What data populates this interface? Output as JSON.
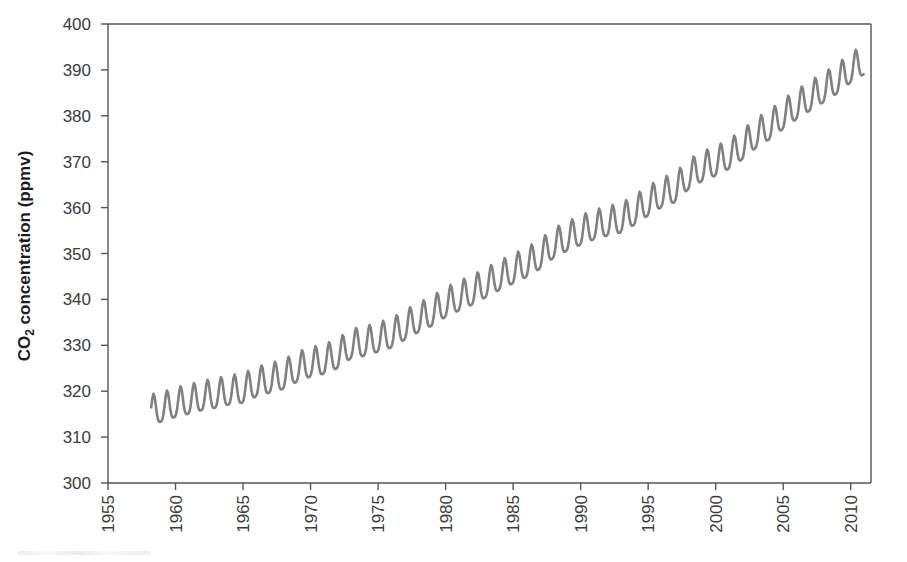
{
  "chart_data": {
    "type": "line",
    "title": "",
    "subtitle": "",
    "xlabel": "",
    "ylabel": "CO2 concentration (ppmv)",
    "ylabel_rich": {
      "prefix": "CO",
      "sub": "2",
      "suffix": " concentration (ppmv)"
    },
    "xlim": [
      1955,
      2011.5
    ],
    "ylim": [
      300,
      400
    ],
    "xticks": [
      1955,
      1960,
      1965,
      1970,
      1975,
      1980,
      1985,
      1990,
      1995,
      2000,
      2005,
      2010
    ],
    "xtick_labels": [
      "1955",
      "1960",
      "1965",
      "1970",
      "1975",
      "1980",
      "1985",
      "1990",
      "1995",
      "2000",
      "2005",
      "2010"
    ],
    "xtick_rotation": 90,
    "yticks": [
      300,
      310,
      320,
      330,
      340,
      350,
      360,
      370,
      380,
      390,
      400
    ],
    "ytick_labels": [
      "300",
      "310",
      "320",
      "330",
      "340",
      "350",
      "360",
      "370",
      "380",
      "390",
      "400"
    ],
    "grid": false,
    "legend": "none",
    "series": [
      {
        "name": "Mauna Loa monthly mean CO2",
        "color": "#808080",
        "line_width": 2.6,
        "marker": "none",
        "seasonal_amplitude_ppmv": 3.2,
        "seasonal_peak_month": 5,
        "x_start": 1958.2,
        "x_end": 2011.0,
        "annual_mean_x": [
          1958,
          1959,
          1960,
          1961,
          1962,
          1963,
          1964,
          1965,
          1966,
          1967,
          1968,
          1969,
          1970,
          1971,
          1972,
          1973,
          1974,
          1975,
          1976,
          1977,
          1978,
          1979,
          1980,
          1981,
          1982,
          1983,
          1984,
          1985,
          1986,
          1987,
          1988,
          1989,
          1990,
          1991,
          1992,
          1993,
          1994,
          1995,
          1996,
          1997,
          1998,
          1999,
          2000,
          2001,
          2002,
          2003,
          2004,
          2005,
          2006,
          2007,
          2008,
          2009,
          2010,
          2011
        ],
        "annual_mean_y": [
          315.3,
          315.9,
          316.9,
          317.6,
          318.4,
          318.9,
          319.6,
          320.0,
          321.4,
          322.2,
          323.0,
          324.6,
          325.7,
          326.3,
          327.5,
          329.7,
          330.2,
          331.1,
          332.0,
          333.8,
          335.4,
          336.8,
          338.7,
          340.1,
          341.4,
          343.0,
          344.6,
          346.0,
          347.4,
          349.2,
          351.6,
          353.1,
          354.4,
          355.6,
          356.4,
          357.1,
          358.8,
          360.8,
          362.6,
          363.7,
          366.6,
          368.3,
          369.5,
          371.0,
          373.1,
          375.6,
          377.4,
          379.7,
          381.8,
          383.7,
          385.5,
          387.4,
          389.8,
          391.6
        ]
      }
    ]
  },
  "figure": {
    "background_color": "#ffffff",
    "axis_color": "#555555",
    "text_color": "#3b3b3b",
    "series_color": "#808080"
  }
}
